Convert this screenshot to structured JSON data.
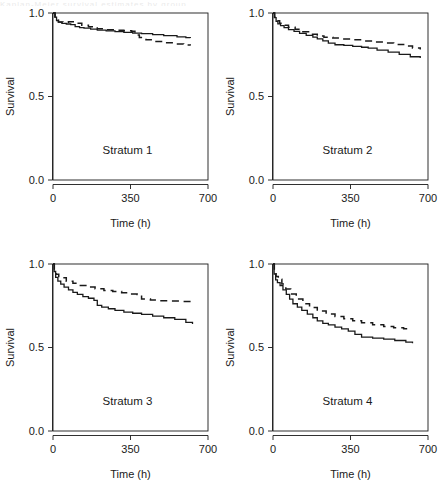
{
  "figure": {
    "kind": "survival-curve-panel-grid",
    "rows": 2,
    "columns": 2,
    "background": "#ffffff",
    "foreground": "#1a1a1a",
    "clipped_header_text": "Kaplan-Meier survival estimates by group"
  },
  "chart_data": [
    {
      "type": "line",
      "title": "Stratum 1",
      "xlabel": "Time (h)",
      "ylabel": "Survival",
      "xlim": [
        0,
        700
      ],
      "ylim": [
        0.0,
        1.0
      ],
      "xticks": [
        0,
        350,
        700
      ],
      "xticklabels": [
        "0",
        "350",
        "700"
      ],
      "yticks": [
        0.0,
        0.5,
        1.0
      ],
      "yticklabels": [
        "0.0",
        "0.5",
        "1.0"
      ],
      "grid": false,
      "legend": "none",
      "series": [
        {
          "name": "solid",
          "style": "solid",
          "color": "#1a1a1a",
          "x": [
            0,
            8,
            16,
            24,
            40,
            60,
            80,
            100,
            120,
            140,
            170,
            200,
            240,
            280,
            320,
            360,
            400,
            450,
            500,
            560,
            600,
            620
          ],
          "y": [
            1.0,
            0.975,
            0.955,
            0.945,
            0.938,
            0.934,
            0.93,
            0.918,
            0.912,
            0.909,
            0.903,
            0.898,
            0.893,
            0.889,
            0.884,
            0.88,
            0.876,
            0.87,
            0.864,
            0.857,
            0.852,
            0.85
          ]
        },
        {
          "name": "dashed",
          "style": "dashed",
          "color": "#1a1a1a",
          "x": [
            0,
            10,
            25,
            45,
            70,
            100,
            130,
            160,
            200,
            240,
            280,
            320,
            355,
            370,
            390,
            420,
            460,
            500,
            545,
            590,
            620
          ],
          "y": [
            1.0,
            0.962,
            0.946,
            0.944,
            0.948,
            0.939,
            0.927,
            0.918,
            0.906,
            0.9,
            0.897,
            0.894,
            0.89,
            0.868,
            0.853,
            0.84,
            0.83,
            0.822,
            0.815,
            0.808,
            0.806
          ]
        }
      ]
    },
    {
      "type": "line",
      "title": "Stratum 2",
      "xlabel": "Time (h)",
      "ylabel": "Survival",
      "xlim": [
        0,
        700
      ],
      "ylim": [
        0.0,
        1.0
      ],
      "xticks": [
        0,
        350,
        700
      ],
      "xticklabels": [
        "0",
        "350",
        "700"
      ],
      "yticks": [
        0.0,
        0.5,
        1.0
      ],
      "yticklabels": [
        "0.0",
        "0.5",
        "1.0"
      ],
      "grid": false,
      "legend": "none",
      "series": [
        {
          "name": "solid",
          "style": "solid",
          "color": "#1a1a1a",
          "x": [
            0,
            6,
            14,
            22,
            34,
            50,
            70,
            95,
            120,
            150,
            180,
            200,
            225,
            250,
            280,
            320,
            360,
            400,
            430,
            470,
            520,
            570,
            620,
            665
          ],
          "y": [
            1.0,
            0.972,
            0.95,
            0.935,
            0.925,
            0.912,
            0.901,
            0.89,
            0.878,
            0.866,
            0.855,
            0.845,
            0.833,
            0.82,
            0.81,
            0.806,
            0.8,
            0.795,
            0.79,
            0.778,
            0.766,
            0.752,
            0.738,
            0.73
          ]
        },
        {
          "name": "dashed",
          "style": "dashed",
          "color": "#1a1a1a",
          "x": [
            0,
            8,
            18,
            30,
            48,
            70,
            100,
            135,
            170,
            200,
            230,
            270,
            310,
            350,
            400,
            450,
            500,
            545,
            590,
            630,
            665
          ],
          "y": [
            1.0,
            0.975,
            0.954,
            0.938,
            0.926,
            0.914,
            0.902,
            0.888,
            0.873,
            0.862,
            0.855,
            0.85,
            0.845,
            0.84,
            0.833,
            0.826,
            0.82,
            0.812,
            0.802,
            0.79,
            0.782
          ]
        }
      ]
    },
    {
      "type": "line",
      "title": "Stratum 3",
      "xlabel": "Time (h)",
      "ylabel": "Survival",
      "xlim": [
        0,
        700
      ],
      "ylim": [
        0.0,
        1.0
      ],
      "xticks": [
        0,
        350,
        700
      ],
      "xticklabels": [
        "0",
        "350",
        "700"
      ],
      "yticks": [
        0.0,
        0.5,
        1.0
      ],
      "yticklabels": [
        "0.0",
        "0.5",
        "1.0"
      ],
      "grid": false,
      "legend": "none",
      "series": [
        {
          "name": "solid",
          "style": "solid",
          "color": "#1a1a1a",
          "x": [
            0,
            5,
            12,
            22,
            35,
            50,
            70,
            90,
            110,
            135,
            160,
            185,
            200,
            220,
            250,
            280,
            320,
            360,
            400,
            450,
            500,
            550,
            600,
            630
          ],
          "y": [
            1.0,
            0.955,
            0.92,
            0.898,
            0.88,
            0.862,
            0.845,
            0.83,
            0.818,
            0.805,
            0.795,
            0.782,
            0.752,
            0.742,
            0.732,
            0.722,
            0.712,
            0.705,
            0.698,
            0.688,
            0.678,
            0.668,
            0.65,
            0.64
          ]
        },
        {
          "name": "dashed",
          "style": "dashed",
          "color": "#1a1a1a",
          "x": [
            0,
            6,
            14,
            26,
            45,
            60,
            90,
            120,
            155,
            190,
            230,
            270,
            310,
            350,
            380,
            400,
            440,
            480,
            530,
            580,
            630
          ],
          "y": [
            1.0,
            0.962,
            0.938,
            0.925,
            0.918,
            0.896,
            0.884,
            0.872,
            0.862,
            0.852,
            0.842,
            0.835,
            0.828,
            0.82,
            0.818,
            0.79,
            0.784,
            0.78,
            0.778,
            0.776,
            0.775
          ]
        }
      ]
    },
    {
      "type": "line",
      "title": "Stratum 4",
      "xlabel": "Time (h)",
      "ylabel": "Survival",
      "xlim": [
        0,
        700
      ],
      "ylim": [
        0.0,
        1.0
      ],
      "xticks": [
        0,
        350,
        700
      ],
      "xticklabels": [
        "0",
        "350",
        "700"
      ],
      "yticks": [
        0.0,
        0.5,
        1.0
      ],
      "yticklabels": [
        "0.0",
        "0.5",
        "1.0"
      ],
      "grid": false,
      "legend": "none",
      "series": [
        {
          "name": "solid",
          "style": "solid",
          "color": "#1a1a1a",
          "x": [
            0,
            5,
            12,
            20,
            32,
            45,
            60,
            75,
            90,
            110,
            130,
            155,
            180,
            200,
            225,
            250,
            280,
            310,
            340,
            370,
            400,
            450,
            500,
            550,
            600,
            630
          ],
          "y": [
            1.0,
            0.94,
            0.905,
            0.888,
            0.87,
            0.845,
            0.818,
            0.79,
            0.762,
            0.742,
            0.722,
            0.7,
            0.678,
            0.66,
            0.645,
            0.635,
            0.622,
            0.612,
            0.598,
            0.578,
            0.562,
            0.556,
            0.55,
            0.542,
            0.532,
            0.525
          ]
        },
        {
          "name": "dashed",
          "style": "dashed",
          "color": "#1a1a1a",
          "x": [
            0,
            6,
            14,
            24,
            40,
            58,
            80,
            105,
            135,
            165,
            200,
            240,
            280,
            320,
            360,
            400,
            450,
            500,
            545,
            590,
            625
          ],
          "y": [
            1.0,
            0.952,
            0.925,
            0.908,
            0.88,
            0.85,
            0.82,
            0.79,
            0.762,
            0.74,
            0.718,
            0.7,
            0.685,
            0.672,
            0.66,
            0.648,
            0.636,
            0.626,
            0.618,
            0.612,
            0.608
          ]
        }
      ]
    }
  ]
}
